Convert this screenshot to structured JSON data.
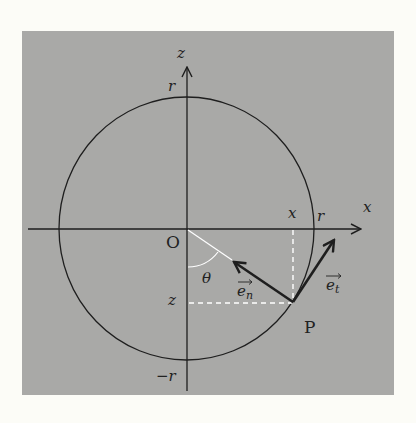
{
  "figure": {
    "background_color": "#fcfcf7",
    "panel_color": "#a9a9a7",
    "line_color": "#1e1e1e",
    "highlight_color": "#ffffff"
  },
  "axes": {
    "horizontal_label": "x",
    "vertical_label": "z"
  },
  "circle": {
    "top_label": "r",
    "right_label": "r",
    "bottom_label": "−r"
  },
  "point": {
    "origin_label": "O",
    "point_label": "P",
    "x_projection_label": "x",
    "z_projection_label": "z",
    "angle_label": "θ"
  },
  "vectors": {
    "normal_label": "e",
    "normal_subscript": "n",
    "tangent_label": "e",
    "tangent_subscript": "t"
  }
}
